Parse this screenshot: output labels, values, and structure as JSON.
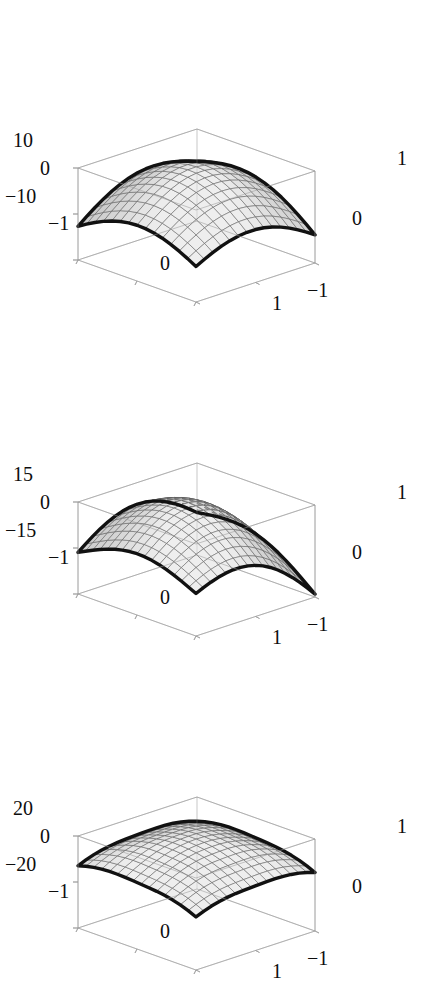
{
  "figure": {
    "background": "#ffffff",
    "panel_count": 3,
    "frame_color": "#9a9a9a",
    "surface_edge_color": "#111111",
    "mesh_color": "#5c5c5c",
    "tick_label_color": "#0d0d0d"
  },
  "chart_data": [
    {
      "type": "surface",
      "title": "",
      "xlabel": "",
      "ylabel": "",
      "zlabel": "",
      "grid": false,
      "legend": "none",
      "xlim": [
        -1,
        1
      ],
      "ylim": [
        -1,
        1
      ],
      "zlim": [
        -10,
        10
      ],
      "xticks": [
        "-1",
        "0",
        "1"
      ],
      "yticks": [
        "-1",
        "0",
        "1"
      ],
      "zticks": [
        "10",
        "0",
        "-10"
      ],
      "surface_shape": "rounded dome, asymmetric teardrop-to-ellipse, peak toward back-left",
      "mesh_lines_u": 14,
      "mesh_lines_v": 14,
      "shading": "grayscale, light toward front-right, darker at back-left rim"
    },
    {
      "type": "surface",
      "title": "",
      "xlabel": "",
      "ylabel": "",
      "zlabel": "",
      "grid": false,
      "legend": "none",
      "xlim": [
        -1,
        1
      ],
      "ylim": [
        -1,
        1
      ],
      "zlim": [
        -15,
        15
      ],
      "xticks": [
        "-1",
        "0",
        "1"
      ],
      "yticks": [
        "-1",
        "0",
        "1"
      ],
      "zticks": [
        "15",
        "0",
        "-15"
      ],
      "surface_shape": "pointed teardrop, tapering to a tip toward right",
      "mesh_lines_u": 16,
      "mesh_lines_v": 16,
      "shading": "grayscale, mid-gray overall, lighter top-center"
    },
    {
      "type": "surface",
      "title": "",
      "xlabel": "",
      "ylabel": "",
      "zlabel": "",
      "grid": false,
      "legend": "none",
      "xlim": [
        -1,
        1
      ],
      "ylim": [
        -1,
        1
      ],
      "zlim": [
        -20,
        20
      ],
      "xticks": [
        "-1",
        "0",
        "1"
      ],
      "yticks": [
        "-1",
        "0",
        "1"
      ],
      "zticks": [
        "20",
        "0",
        "-20"
      ],
      "surface_shape": "rounded rectangle / squircle, broad flat top",
      "mesh_lines_u": 15,
      "mesh_lines_v": 15,
      "shading": "grayscale, light center, slightly darker left edge"
    }
  ],
  "panels": [
    {
      "id": "plot-1",
      "z_ticks": [
        {
          "label": "10",
          "x": 13,
          "y": 130
        },
        {
          "label": "0",
          "x": 40,
          "y": 158
        },
        {
          "label": "−10",
          "x": 5,
          "y": 186
        }
      ],
      "x_ticks": [
        {
          "label": "−1",
          "x": 48,
          "y": 213
        },
        {
          "label": "0",
          "x": 160,
          "y": 253
        },
        {
          "label": "1",
          "x": 272,
          "y": 293
        }
      ],
      "y_ticks": [
        {
          "label": "1",
          "x": 397,
          "y": 148
        },
        {
          "label": "0",
          "x": 352,
          "y": 208
        },
        {
          "label": "−1",
          "x": 307,
          "y": 280
        }
      ]
    },
    {
      "id": "plot-2",
      "z_ticks": [
        {
          "label": "15",
          "x": 13,
          "y": 130
        },
        {
          "label": "0",
          "x": 40,
          "y": 158
        },
        {
          "label": "−15",
          "x": 5,
          "y": 186
        }
      ],
      "x_ticks": [
        {
          "label": "−1",
          "x": 48,
          "y": 213
        },
        {
          "label": "0",
          "x": 160,
          "y": 253
        },
        {
          "label": "1",
          "x": 272,
          "y": 293
        }
      ],
      "y_ticks": [
        {
          "label": "1",
          "x": 397,
          "y": 148
        },
        {
          "label": "0",
          "x": 352,
          "y": 208
        },
        {
          "label": "−1",
          "x": 307,
          "y": 280
        }
      ]
    },
    {
      "id": "plot-3",
      "z_ticks": [
        {
          "label": "20",
          "x": 13,
          "y": 130
        },
        {
          "label": "0",
          "x": 40,
          "y": 158
        },
        {
          "label": "−20",
          "x": 5,
          "y": 186
        }
      ],
      "x_ticks": [
        {
          "label": "−1",
          "x": 48,
          "y": 213
        },
        {
          "label": "0",
          "x": 160,
          "y": 253
        },
        {
          "label": "1",
          "x": 272,
          "y": 293
        }
      ],
      "y_ticks": [
        {
          "label": "1",
          "x": 397,
          "y": 148
        },
        {
          "label": "0",
          "x": 352,
          "y": 208
        },
        {
          "label": "−1",
          "x": 307,
          "y": 280
        }
      ]
    }
  ]
}
